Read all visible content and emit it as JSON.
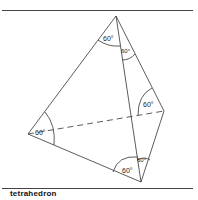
{
  "figure": {
    "caption": "tetrahedron",
    "angle_labels": [
      "60°",
      "60°",
      "60°",
      "60°",
      "60°",
      "60°"
    ]
  },
  "vertices": {
    "top": [
      116,
      16
    ],
    "left": [
      28,
      134
    ],
    "bottom": [
      141,
      182
    ],
    "right": [
      164,
      111
    ]
  },
  "colors": {
    "line": "#333333",
    "rule": "#444444",
    "background": "#ffffff"
  }
}
